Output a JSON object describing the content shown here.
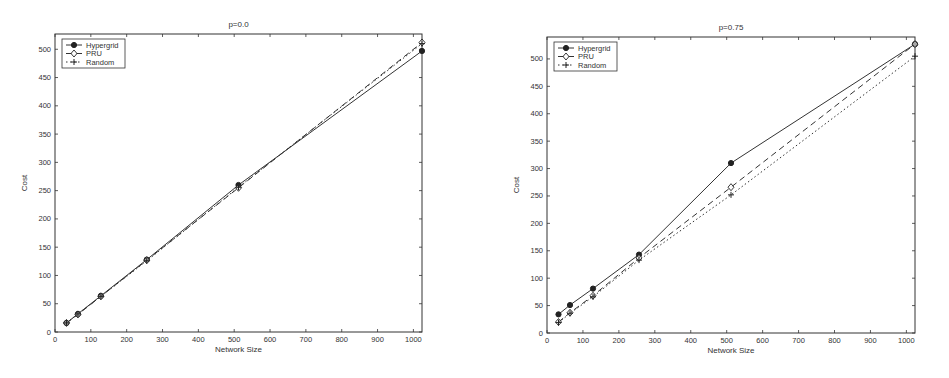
{
  "chart_data": [
    {
      "type": "line",
      "title": "p=0.0",
      "xlabel": "Network Size",
      "ylabel": "Cost",
      "xlim": [
        0,
        1024
      ],
      "ylim": [
        0,
        527
      ],
      "xticks": [
        0,
        100,
        200,
        300,
        400,
        500,
        600,
        700,
        800,
        900,
        1000
      ],
      "yticks": [
        0,
        50,
        100,
        150,
        200,
        250,
        300,
        350,
        400,
        450,
        500
      ],
      "grid": false,
      "legend_position": "upper-left",
      "x": [
        32,
        64,
        128,
        256,
        512,
        1024
      ],
      "series": [
        {
          "name": "Hypergrid",
          "marker": "filled-circle",
          "line": "solid",
          "values": [
            16,
            32,
            64,
            128,
            260,
            497
          ]
        },
        {
          "name": "PRU",
          "marker": "open-diamond",
          "line": "dashed",
          "values": [
            16,
            31,
            63,
            127,
            255,
            512
          ]
        },
        {
          "name": "Random",
          "marker": "plus",
          "line": "dotted",
          "values": [
            16,
            32,
            63,
            126,
            256,
            510
          ]
        }
      ],
      "frame": {
        "left": 55,
        "right": 422,
        "top": 34,
        "bottom": 332
      }
    },
    {
      "type": "line",
      "title": "p=0.75",
      "xlabel": "Network Size",
      "ylabel": "Cost",
      "xlim": [
        0,
        1024
      ],
      "ylim": [
        0,
        540
      ],
      "xticks": [
        0,
        100,
        200,
        300,
        400,
        500,
        600,
        700,
        800,
        900,
        1000
      ],
      "yticks": [
        0,
        50,
        100,
        150,
        200,
        250,
        300,
        350,
        400,
        450,
        500
      ],
      "grid": false,
      "legend_position": "upper-left",
      "x": [
        32,
        64,
        128,
        256,
        512,
        1024
      ],
      "series": [
        {
          "name": "Hypergrid",
          "marker": "filled-circle",
          "line": "solid",
          "values": [
            34,
            51,
            81,
            143,
            310,
            527
          ]
        },
        {
          "name": "PRU",
          "marker": "open-diamond",
          "line": "dashed",
          "values": [
            20,
            37,
            68,
            137,
            266,
            527
          ]
        },
        {
          "name": "Random",
          "marker": "plus",
          "line": "dotted",
          "values": [
            19,
            36,
            66,
            133,
            252,
            505
          ]
        }
      ],
      "frame": {
        "left": 72,
        "right": 440,
        "top": 37,
        "bottom": 333
      }
    }
  ]
}
